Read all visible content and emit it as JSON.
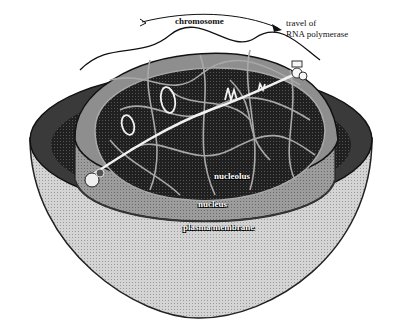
{
  "diagram": {
    "type": "cell cross-section illustration (transcription)",
    "labels": {
      "chromosome": "chromosome",
      "travel_line1": "travel of",
      "travel_line2": "RNA polymerase",
      "nucleolus": "nucleolus",
      "nucleus": "nucleus",
      "plasma_membrane": "plasma membrane"
    },
    "colors": {
      "background": "#ffffff",
      "cytoplasm": "#c8c8c8",
      "cell_rim_dark": "#3a3a3a",
      "nucleus_wall": "#9a9a9a",
      "nucleus_top": "#8c8c8c",
      "nucleoplasm": "#1c1c1c",
      "chromatin": "#a0a0a0",
      "dna_strand": "#f2f2f2",
      "outline": "#111111"
    }
  }
}
